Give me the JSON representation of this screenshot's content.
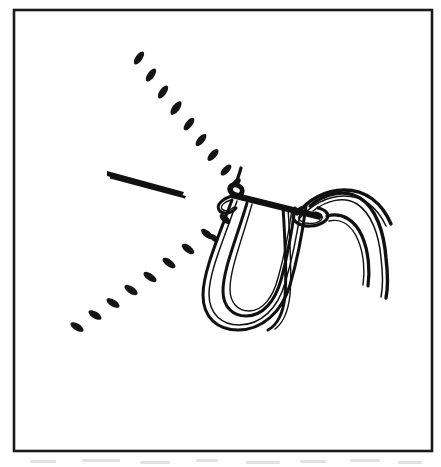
{
  "figure": {
    "title": "Surgical knot tying — instrument tie with loop",
    "background_color": "#ffffff",
    "ink_color": "#111111",
    "frame": {
      "name": "illustration-border",
      "stroke_color": "#1a1a1a",
      "stroke_width": 2.6,
      "x": 14,
      "y": 10,
      "width": 418,
      "height": 441
    },
    "elements": [
      {
        "name": "needle",
        "label": "needle",
        "kind": "tapered-sliver",
        "description": "Thin elongated tapered needle pointing down-right",
        "from": [
          108,
          172
        ],
        "to": [
          184,
          194
        ]
      },
      {
        "name": "upper-dashed-suture-path",
        "label": "upper dashed suture path",
        "kind": "dashed-line",
        "dash_count": 9,
        "from": [
          137,
          51
        ],
        "to": [
          238,
          187
        ]
      },
      {
        "name": "lower-dashed-suture-path",
        "label": "lower dashed suture path",
        "kind": "dashed-line",
        "dash_count": 9,
        "from": [
          73,
          327
        ],
        "to": [
          232,
          203
        ]
      },
      {
        "name": "knot-crossing-bar",
        "label": "crossing strand over knot",
        "kind": "stroke"
      },
      {
        "name": "left-knot-cinch",
        "label": "left knot cinch",
        "kind": "loop-knot"
      },
      {
        "name": "right-knot-eye",
        "label": "right knot eye",
        "kind": "loop-knot"
      },
      {
        "name": "suture-loop",
        "label": "large hanging suture loop",
        "kind": "u-loop",
        "strands": 3
      },
      {
        "name": "right-thread-tail-upper",
        "label": "upper curved thread tail",
        "kind": "arc"
      },
      {
        "name": "right-thread-tail-lower",
        "label": "lower curved thread tail",
        "kind": "arc"
      }
    ]
  }
}
